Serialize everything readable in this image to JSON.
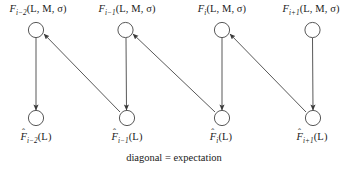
{
  "figure": {
    "caption": "diagonal = expectation",
    "background_color": "#ffffff",
    "stroke_color": "#3a3a3a",
    "node_fill_color": "#ffffff"
  },
  "columns": [
    {
      "index": "i-2",
      "top_node": {
        "name": "F",
        "subscript": "i−2",
        "args": "(L, M, σ)",
        "label": "F",
        "full_label": "F_{i-2}(L, M, σ)",
        "cx": 36,
        "cy": 30
      },
      "bottom_node": {
        "name": "F",
        "hat": "ˆ",
        "subscript": "i−2",
        "args": "(L)",
        "label": "F",
        "full_label": "F̂_{i-2}(L)",
        "cx": 36,
        "cy": 118
      }
    },
    {
      "index": "i-1",
      "top_node": {
        "name": "F",
        "subscript": "i−1",
        "args": "(L, M, σ)",
        "label": "F",
        "full_label": "F_{i-1}(L, M, σ)",
        "cx": 125,
        "cy": 30
      },
      "bottom_node": {
        "name": "F",
        "hat": "ˆ",
        "subscript": "i−1",
        "args": "(L)",
        "label": "F",
        "full_label": "F̂_{i-1}(L)",
        "cx": 127,
        "cy": 118
      }
    },
    {
      "index": "i",
      "top_node": {
        "name": "F",
        "subscript": "i",
        "args": "(L, M, σ)",
        "label": "F",
        "full_label": "F_{i}(L, M, σ)",
        "cx": 222,
        "cy": 30
      },
      "bottom_node": {
        "name": "F",
        "hat": "ˆ",
        "subscript": "i",
        "args": "(L)",
        "label": "F",
        "full_label": "F̂_{i}(L)",
        "cx": 222,
        "cy": 118
      }
    },
    {
      "index": "i+1",
      "top_node": {
        "name": "F",
        "subscript": "i+1",
        "args": "(L, M, σ)",
        "label": "F",
        "full_label": "F_{i+1}(L, M, σ)",
        "cx": 312,
        "cy": 30
      },
      "bottom_node": {
        "name": "F",
        "hat": "ˆ",
        "subscript": "i+1",
        "args": "(L)",
        "label": "F",
        "full_label": "F̂_{i+1}(L)",
        "cx": 313,
        "cy": 118
      }
    }
  ],
  "edges": {
    "vertical": [
      {
        "from": "F_{i-2}",
        "to": "F̂_{i-2}",
        "direction": "down"
      },
      {
        "from": "F_{i-1}",
        "to": "F̂_{i-1}",
        "direction": "down"
      },
      {
        "from": "F_{i}",
        "to": "F̂_{i}",
        "direction": "down"
      },
      {
        "from": "F_{i+1}",
        "to": "F̂_{i+1}",
        "direction": "down"
      }
    ],
    "diagonal": [
      {
        "from": "F̂_{i-1}",
        "to": "F_{i-2}",
        "direction": "up-left"
      },
      {
        "from": "F̂_{i}",
        "to": "F_{i-1}",
        "direction": "up-left"
      },
      {
        "from": "F̂_{i+1}",
        "to": "F_{i}",
        "direction": "up-left"
      }
    ]
  }
}
